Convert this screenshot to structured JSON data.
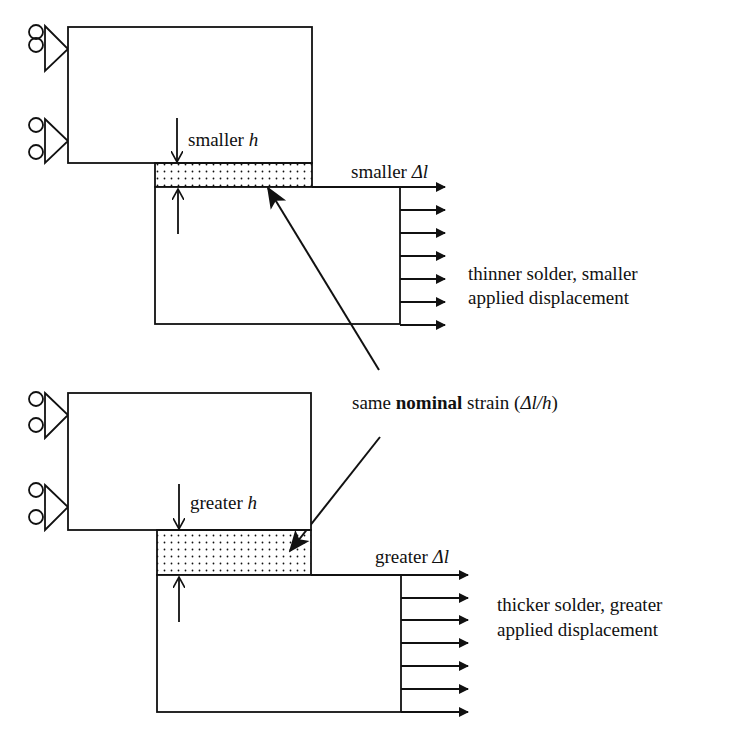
{
  "diagram": {
    "top_case": {
      "height_label": "smaller",
      "height_symbol": "h",
      "displacement_label": "smaller",
      "displacement_symbol": "Δl",
      "caption_line1": "thinner solder, smaller",
      "caption_line2": "applied displacement"
    },
    "shared": {
      "text_pre": "same",
      "text_bold": "nominal",
      "text_mid": "strain (",
      "text_formula": "Δl/h",
      "text_post": ")"
    },
    "bottom_case": {
      "height_label": "greater",
      "height_symbol": "h",
      "displacement_label": "greater",
      "displacement_symbol": "Δl",
      "caption_line1": "thicker solder, greater",
      "caption_line2": "applied displacement"
    },
    "colors": {
      "stroke": "#111111",
      "background": "#ffffff"
    }
  }
}
